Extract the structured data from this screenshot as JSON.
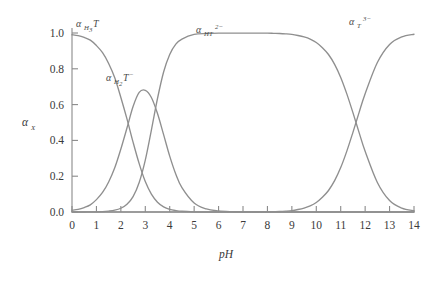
{
  "chart_data": {
    "type": "line",
    "title": "",
    "subtitle": "",
    "xlabel": "pH",
    "ylabel": "αX",
    "xlim": [
      0,
      14
    ],
    "ylim": [
      0.0,
      1.0
    ],
    "grid": false,
    "legend_position": "inline-annotations",
    "xticks": [
      "0",
      "1",
      "2",
      "3",
      "4",
      "5",
      "6",
      "7",
      "8",
      "9",
      "10",
      "11",
      "12",
      "13",
      "14"
    ],
    "yticks": [
      "0.0",
      "0.2",
      "0.4",
      "0.6",
      "0.8",
      "1.0"
    ],
    "x": [
      0,
      0.25,
      0.5,
      0.75,
      1,
      1.25,
      1.5,
      1.75,
      2,
      2.25,
      2.5,
      2.75,
      3,
      3.25,
      3.5,
      3.75,
      4,
      4.25,
      4.5,
      5,
      5.5,
      6,
      6.5,
      7,
      7.5,
      8,
      8.25,
      8.5,
      8.75,
      9,
      9.25,
      9.5,
      9.75,
      10,
      10.25,
      10.5,
      10.75,
      11,
      11.25,
      11.5,
      11.75,
      12,
      12.5,
      13,
      13.5,
      14
    ],
    "series": [
      {
        "name": "αH3T",
        "label": "αH₃T",
        "color": "#8f8f8f",
        "pKa": 2.1,
        "values": [
          0.99,
          0.985,
          0.975,
          0.96,
          0.93,
          0.89,
          0.83,
          0.75,
          0.64,
          0.52,
          0.39,
          0.27,
          0.17,
          0.1,
          0.055,
          0.029,
          0.015,
          0.008,
          0.004,
          0.001,
          0.0,
          0.0,
          0.0,
          0.0,
          0.0,
          0.0,
          0.0,
          0.0,
          0.0,
          0.0,
          0.0,
          0.0,
          0.0,
          0.0,
          0.0,
          0.0,
          0.0,
          0.0,
          0.0,
          0.0,
          0.0,
          0.0,
          0.0,
          0.0,
          0.0,
          0.0
        ]
      },
      {
        "name": "αH2T-",
        "label": "αH₂T⁻",
        "color": "#8f8f8f",
        "pKa1": 2.1,
        "pKa2": 3.1,
        "peak_value": 0.68,
        "peak_ph": 2.6,
        "values": [
          0.01,
          0.015,
          0.025,
          0.04,
          0.069,
          0.109,
          0.168,
          0.247,
          0.352,
          0.469,
          0.589,
          0.668,
          0.68,
          0.64,
          0.55,
          0.432,
          0.312,
          0.211,
          0.136,
          0.05,
          0.017,
          0.006,
          0.002,
          0.001,
          0.0,
          0.0,
          0.0,
          0.0,
          0.0,
          0.0,
          0.0,
          0.0,
          0.0,
          0.0,
          0.0,
          0.0,
          0.0,
          0.0,
          0.0,
          0.0,
          0.0,
          0.0,
          0.0,
          0.0,
          0.0,
          0.0
        ]
      },
      {
        "name": "αHT2-",
        "label": "αHT²⁻",
        "color": "#8f8f8f",
        "pKa2": 3.1,
        "pKa3": 10.05,
        "values": [
          0.0,
          0.0,
          0.0,
          0.001,
          0.001,
          0.002,
          0.005,
          0.01,
          0.021,
          0.043,
          0.086,
          0.165,
          0.29,
          0.458,
          0.634,
          0.782,
          0.88,
          0.938,
          0.966,
          0.992,
          0.997,
          0.999,
          0.999,
          0.999,
          0.999,
          0.999,
          0.998,
          0.997,
          0.995,
          0.992,
          0.986,
          0.978,
          0.966,
          0.947,
          0.918,
          0.88,
          0.825,
          0.752,
          0.66,
          0.555,
          0.445,
          0.339,
          0.165,
          0.064,
          0.022,
          0.007
        ]
      },
      {
        "name": "αT3-",
        "label": "αT³⁻",
        "color": "#8f8f8f",
        "pKa3": 10.05,
        "values": [
          0.0,
          0.0,
          0.0,
          0.0,
          0.0,
          0.0,
          0.0,
          0.0,
          0.0,
          0.0,
          0.0,
          0.0,
          0.0,
          0.0,
          0.0,
          0.0,
          0.0,
          0.0,
          0.0,
          0.0,
          0.0,
          0.0,
          0.0,
          0.0,
          0.0,
          0.001,
          0.002,
          0.003,
          0.005,
          0.008,
          0.014,
          0.022,
          0.034,
          0.053,
          0.082,
          0.12,
          0.175,
          0.248,
          0.34,
          0.445,
          0.555,
          0.661,
          0.835,
          0.936,
          0.978,
          0.993
        ]
      }
    ],
    "annotations": [
      {
        "id": "label-h3t",
        "text": "αH₃T",
        "x_px": 78,
        "y_px": 24
      },
      {
        "id": "label-h2t",
        "text": "αH₂T⁻",
        "x_px": 108,
        "y_px": 78
      },
      {
        "id": "label-ht2",
        "text": "αHT²⁻",
        "x_px": 198,
        "y_px": 30
      },
      {
        "id": "label-t3",
        "text": "αT³⁻",
        "x_px": 350,
        "y_px": 22
      }
    ]
  },
  "axes": {
    "x_title": "pH",
    "y_title_alpha": "α",
    "y_title_sub": "X"
  },
  "labels": {
    "h3t_alpha": "α",
    "h3t_sub": "H",
    "h3t_sub3": "3",
    "h3t_t": "T",
    "h2t_alpha": "α",
    "h2t_sub": "H",
    "h2t_sub2": "2",
    "h2t_t": "T",
    "h2t_charge": "−",
    "ht2_alpha": "α",
    "ht2_ht": "HT",
    "ht2_charge": "2−",
    "t3_alpha": "α",
    "t3_t": "T",
    "t3_charge": "3−"
  },
  "colors": {
    "curve": "#8f8f8f",
    "axis": "#8a8a8a",
    "text": "#3a3a3a",
    "background": "#ffffff"
  }
}
